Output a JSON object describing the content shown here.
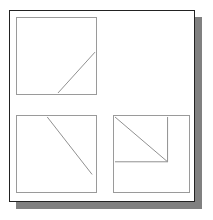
{
  "figure": {
    "background_color": "#ffffff",
    "frame": {
      "border_color": "#222222",
      "fill_color": "#ffffff",
      "shadow_color": "#808080",
      "shadow_offset_x": 7,
      "shadow_offset_y": 7
    },
    "panel_border_color": "#9a9a9a",
    "line_color": "#8d8d8d"
  },
  "panels": [
    {
      "id": "panel-top-left",
      "name": "top-left-square",
      "lines": [
        {
          "name": "ascending-diagonal",
          "x1": 42,
          "y1": 77,
          "x2": 80,
          "y2": 35
        }
      ]
    },
    {
      "id": "panel-bottom-left",
      "name": "bottom-left-square",
      "lines": [
        {
          "name": "descending-diagonal",
          "x1": 31,
          "y1": 1,
          "x2": 77,
          "y2": 60
        }
      ]
    },
    {
      "id": "panel-bottom-right",
      "name": "bottom-right-square",
      "lines": [
        {
          "name": "descending-diagonal",
          "x1": 1,
          "y1": 1,
          "x2": 55,
          "y2": 47
        },
        {
          "name": "vertical-edge",
          "x1": 55,
          "y1": 1,
          "x2": 55,
          "y2": 47
        },
        {
          "name": "horizontal-edge",
          "x1": 1,
          "y1": 47,
          "x2": 55,
          "y2": 47
        }
      ]
    }
  ]
}
